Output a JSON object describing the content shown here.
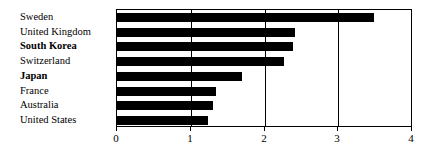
{
  "chart_data": {
    "type": "bar",
    "orientation": "horizontal",
    "title": "",
    "subtitle": "",
    "xlabel": "",
    "ylabel": "",
    "xlim": [
      0,
      4
    ],
    "xticks": [
      "0",
      "1",
      "2",
      "3",
      "4"
    ],
    "xtick_values": [
      0,
      1,
      2,
      3,
      4
    ],
    "grid": "vertical",
    "gridline_values": [
      1,
      2,
      3
    ],
    "legend": "none",
    "bar_color": "#000000",
    "background_color": "#ffffff",
    "axis_color": "#000000",
    "categories": [
      "Sweden",
      "United Kingdom",
      "South Korea",
      "Switzerland",
      "Japan",
      "France",
      "Australia",
      "United States"
    ],
    "values": [
      3.49,
      2.41,
      2.38,
      2.26,
      1.7,
      1.34,
      1.3,
      1.24
    ],
    "emphasized_categories": [
      "South Korea",
      "Japan"
    ],
    "bars": [
      {
        "label": "Sweden",
        "value": 3.49,
        "bold": false
      },
      {
        "label": "United Kingdom",
        "value": 2.41,
        "bold": false
      },
      {
        "label": "South Korea",
        "value": 2.38,
        "bold": true
      },
      {
        "label": "Switzerland",
        "value": 2.26,
        "bold": false
      },
      {
        "label": "Japan",
        "value": 1.7,
        "bold": true
      },
      {
        "label": "France",
        "value": 1.34,
        "bold": false
      },
      {
        "label": "Australia",
        "value": 1.3,
        "bold": false
      },
      {
        "label": "United States",
        "value": 1.24,
        "bold": false
      }
    ]
  }
}
